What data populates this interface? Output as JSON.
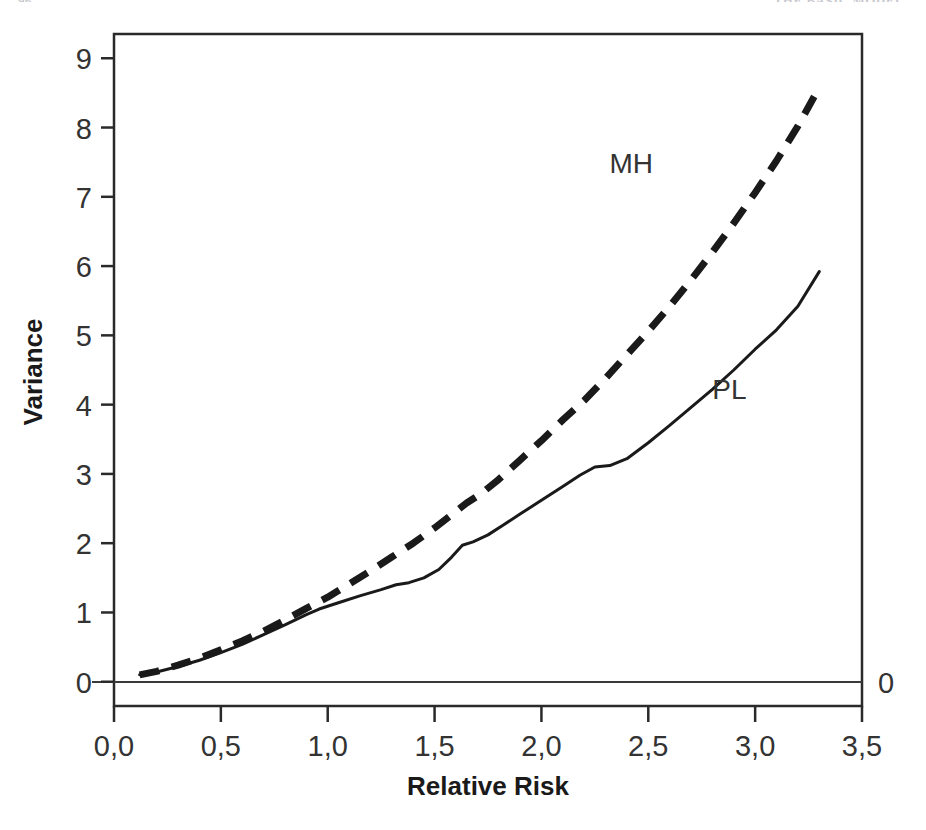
{
  "page": {
    "running_head_left": "96",
    "running_head_right": "THE BASIC MODEL"
  },
  "chart_data": {
    "type": "line",
    "title": "",
    "xlabel": "Relative Risk",
    "ylabel": "Variance",
    "xlim": [
      0.0,
      3.5
    ],
    "ylim": [
      -0.35,
      9.35
    ],
    "xticks": [
      0.0,
      0.5,
      1.0,
      1.5,
      2.0,
      2.5,
      3.0,
      3.5
    ],
    "xticklabels": [
      "0,0",
      "0,5",
      "1,0",
      "1,5",
      "2,0",
      "2,5",
      "3,0",
      "3,5"
    ],
    "yticks": [
      0,
      1,
      2,
      3,
      4,
      5,
      6,
      7,
      8,
      9
    ],
    "yticklabels": [
      "0",
      "1",
      "2",
      "3",
      "4",
      "5",
      "6",
      "7",
      "8",
      "9"
    ],
    "grid": false,
    "legend_position": "inline-annotations",
    "reference_lines": [
      {
        "name": "zero-line",
        "axis": "y",
        "value": 0,
        "label": "0",
        "label_position": "right-outside"
      }
    ],
    "series": [
      {
        "name": "MH",
        "label": "MH",
        "style": "dashed",
        "color": "#1a1a1a",
        "linewidth": 7,
        "annotation": {
          "text": "MH",
          "x": 2.42,
          "y": 7.35
        },
        "x": [
          0.12,
          0.2,
          0.3,
          0.4,
          0.5,
          0.6,
          0.7,
          0.8,
          0.9,
          1.0,
          1.1,
          1.2,
          1.3,
          1.4,
          1.5,
          1.6,
          1.65,
          1.72,
          1.8,
          1.9,
          2.0,
          2.1,
          2.2,
          2.3,
          2.4,
          2.5,
          2.6,
          2.7,
          2.8,
          2.9,
          3.0,
          3.1,
          3.2,
          3.3
        ],
        "y": [
          0.1,
          0.15,
          0.24,
          0.34,
          0.46,
          0.59,
          0.73,
          0.89,
          1.06,
          1.22,
          1.41,
          1.6,
          1.8,
          2.0,
          2.22,
          2.46,
          2.58,
          2.72,
          2.92,
          3.2,
          3.48,
          3.78,
          4.06,
          4.38,
          4.72,
          5.06,
          5.42,
          5.8,
          6.2,
          6.62,
          7.06,
          7.52,
          8.02,
          8.58
        ]
      },
      {
        "name": "PL",
        "label": "PL",
        "style": "solid",
        "color": "#1a1a1a",
        "linewidth": 3,
        "annotation": {
          "text": "PL",
          "x": 2.88,
          "y": 4.08
        },
        "x": [
          0.12,
          0.2,
          0.3,
          0.4,
          0.5,
          0.6,
          0.7,
          0.8,
          0.9,
          0.96,
          1.05,
          1.15,
          1.25,
          1.32,
          1.38,
          1.45,
          1.52,
          1.58,
          1.63,
          1.68,
          1.75,
          1.82,
          1.9,
          2.0,
          2.1,
          2.18,
          2.25,
          2.32,
          2.4,
          2.5,
          2.6,
          2.7,
          2.8,
          2.9,
          3.0,
          3.1,
          3.2,
          3.3
        ],
        "y": [
          0.1,
          0.14,
          0.22,
          0.31,
          0.42,
          0.54,
          0.68,
          0.82,
          0.97,
          1.05,
          1.14,
          1.24,
          1.33,
          1.4,
          1.43,
          1.5,
          1.62,
          1.8,
          1.97,
          2.02,
          2.12,
          2.26,
          2.42,
          2.62,
          2.82,
          2.98,
          3.1,
          3.12,
          3.22,
          3.45,
          3.7,
          3.96,
          4.22,
          4.5,
          4.8,
          5.08,
          5.42,
          5.92
        ]
      }
    ]
  }
}
